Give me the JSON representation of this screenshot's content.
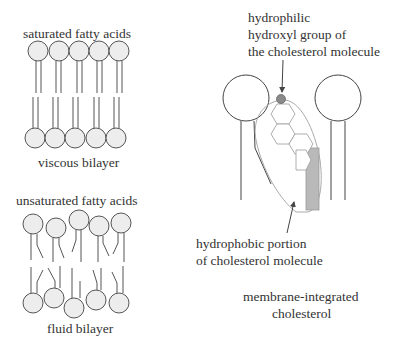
{
  "saturated": {
    "title": "saturated fatty acids",
    "caption": "viscous bilayer"
  },
  "unsaturated": {
    "title": "unsaturated fatty acids",
    "caption": "fluid bilayer"
  },
  "cholesterol": {
    "hydrophilic_label": [
      "hydrophilic",
      "hydroxyl group of",
      "the cholesterol molecule"
    ],
    "hydrophobic_label": [
      "hydrophobic portion",
      "of cholesterol molecule"
    ],
    "caption": [
      "membrane-integrated",
      "cholesterol"
    ]
  },
  "colors": {
    "head_fill": "#ededed",
    "line": "#555555",
    "hydroxyl": "#8a8a8a",
    "hydrophobic_fill": "#b9b9b9",
    "outline_light": "#aaaaaa"
  }
}
